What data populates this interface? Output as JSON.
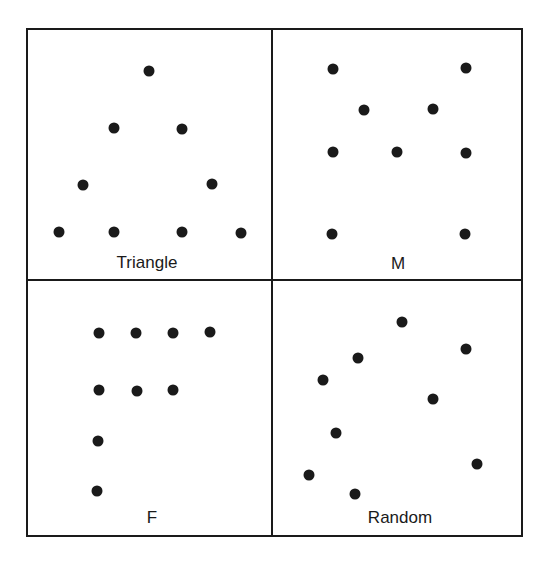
{
  "figure": {
    "colors": {
      "background": "#ffffff",
      "ink": "#1a1a1a"
    },
    "frame": {
      "left": 27,
      "top": 29,
      "right": 522,
      "bottom": 536,
      "split_x": 272,
      "split_y": 280
    },
    "dot_radius": 5.5,
    "panels": [
      {
        "id": "triangle",
        "label": "Triangle",
        "label_pos": [
          147,
          268
        ],
        "dots": [
          [
            149,
            71
          ],
          [
            114,
            128
          ],
          [
            182,
            129
          ],
          [
            83,
            185
          ],
          [
            212,
            184
          ],
          [
            59,
            232
          ],
          [
            114,
            232
          ],
          [
            182,
            232
          ],
          [
            241,
            233
          ]
        ]
      },
      {
        "id": "m",
        "label": "M",
        "label_pos": [
          398,
          269
        ],
        "dots": [
          [
            333,
            69
          ],
          [
            466,
            68
          ],
          [
            364,
            110
          ],
          [
            433,
            109
          ],
          [
            333,
            152
          ],
          [
            397,
            152
          ],
          [
            466,
            153
          ],
          [
            332,
            234
          ],
          [
            465,
            234
          ]
        ]
      },
      {
        "id": "f",
        "label": "F",
        "label_pos": [
          152,
          523
        ],
        "dots": [
          [
            99,
            333
          ],
          [
            136,
            333
          ],
          [
            173,
            333
          ],
          [
            210,
            332
          ],
          [
            99,
            390
          ],
          [
            137,
            391
          ],
          [
            173,
            390
          ],
          [
            98,
            441
          ],
          [
            97,
            491
          ]
        ]
      },
      {
        "id": "random",
        "label": "Random",
        "label_pos": [
          400,
          523
        ],
        "dots": [
          [
            402,
            322
          ],
          [
            466,
            349
          ],
          [
            358,
            358
          ],
          [
            323,
            380
          ],
          [
            433,
            399
          ],
          [
            336,
            433
          ],
          [
            477,
            464
          ],
          [
            309,
            475
          ],
          [
            355,
            494
          ]
        ]
      }
    ]
  }
}
